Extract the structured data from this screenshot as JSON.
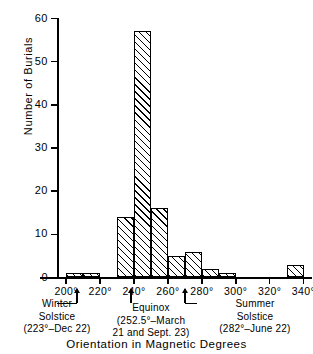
{
  "chart_data": {
    "type": "bar",
    "title": "",
    "xlabel": "Orientation in Magnetic Degrees",
    "ylabel": "Number of Burials",
    "xlim": [
      195,
      345
    ],
    "ylim": [
      0,
      60
    ],
    "bin_width": 10,
    "grid": false,
    "legend": null,
    "x_tick_labels": [
      "200°",
      "220°",
      "240°",
      "260°",
      "280°",
      "300°",
      "320°",
      "340°"
    ],
    "x_tick_values": [
      200,
      220,
      240,
      260,
      280,
      300,
      320,
      340
    ],
    "y_tick_labels": [
      "0",
      "10",
      "20",
      "30",
      "40",
      "50",
      "60"
    ],
    "y_tick_values": [
      0,
      10,
      20,
      30,
      40,
      50,
      60
    ],
    "categories": [
      "200-210",
      "210-220",
      "230-240",
      "240-250",
      "250-260",
      "260-270",
      "270-280",
      "280-290",
      "290-300",
      "330-340"
    ],
    "bins": [
      {
        "start": 200,
        "end": 210,
        "value": 1
      },
      {
        "start": 210,
        "end": 220,
        "value": 1
      },
      {
        "start": 230,
        "end": 240,
        "value": 14
      },
      {
        "start": 240,
        "end": 250,
        "value": 57
      },
      {
        "start": 250,
        "end": 260,
        "value": 16
      },
      {
        "start": 260,
        "end": 270,
        "value": 5
      },
      {
        "start": 270,
        "end": 280,
        "value": 6
      },
      {
        "start": 280,
        "end": 290,
        "value": 2
      },
      {
        "start": 290,
        "end": 300,
        "value": 1
      },
      {
        "start": 330,
        "end": 340,
        "value": 3
      }
    ],
    "values": [
      1,
      1,
      14,
      57,
      16,
      5,
      6,
      2,
      1,
      3
    ],
    "annotations": [
      {
        "name": "winter-solstice",
        "degrees": 223,
        "lines": [
          "Winter",
          "Solstice",
          "(223°–Dec 22)"
        ]
      },
      {
        "name": "equinox",
        "degrees": 252.5,
        "lines": [
          "Equinox",
          "(252.5°–March",
          "21 and Sept. 23)"
        ]
      },
      {
        "name": "summer-solstice",
        "degrees": 282,
        "lines": [
          "Summer",
          "Solstice",
          "(282°–June 22)"
        ]
      }
    ]
  },
  "annotation_text": {
    "winter": {
      "l1": "Winter",
      "l2": "Solstice",
      "l3": "(223°–Dec 22)"
    },
    "equinox": {
      "l1": "Equinox",
      "l2": "(252.5°–March",
      "l3": "21 and Sept. 23)"
    },
    "summer": {
      "l1": "Summer",
      "l2": "Solstice",
      "l3": "(282°–June 22)"
    }
  }
}
